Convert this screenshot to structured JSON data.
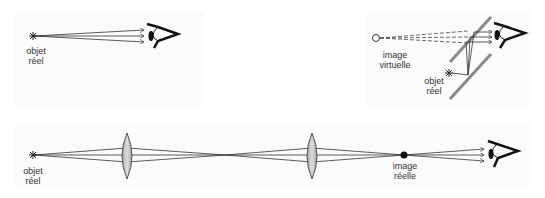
{
  "panels": {
    "direct_view": {
      "object_label_line1": "objet",
      "object_label_line2": "réel"
    },
    "mirror_view": {
      "image_label_line1": "image",
      "image_label_line2": "virtuelle",
      "object_label_line1": "objet",
      "object_label_line2": "réel"
    },
    "lens_system": {
      "object_label_line1": "objet",
      "object_label_line2": "réel",
      "image_label_line1": "image",
      "image_label_line2": "réelle"
    }
  },
  "colors": {
    "line": "#333333",
    "lens_fill": "#c8c8c8",
    "mirror": "#8a8a8a",
    "panel_bg": "#fbfbfb"
  },
  "icons": {
    "object": "asterisk-star",
    "eye": "eye-icon",
    "virtual_image": "hollow-circle",
    "real_image": "filled-dot",
    "lens": "biconvex-lens",
    "mirror": "plane-mirror"
  }
}
